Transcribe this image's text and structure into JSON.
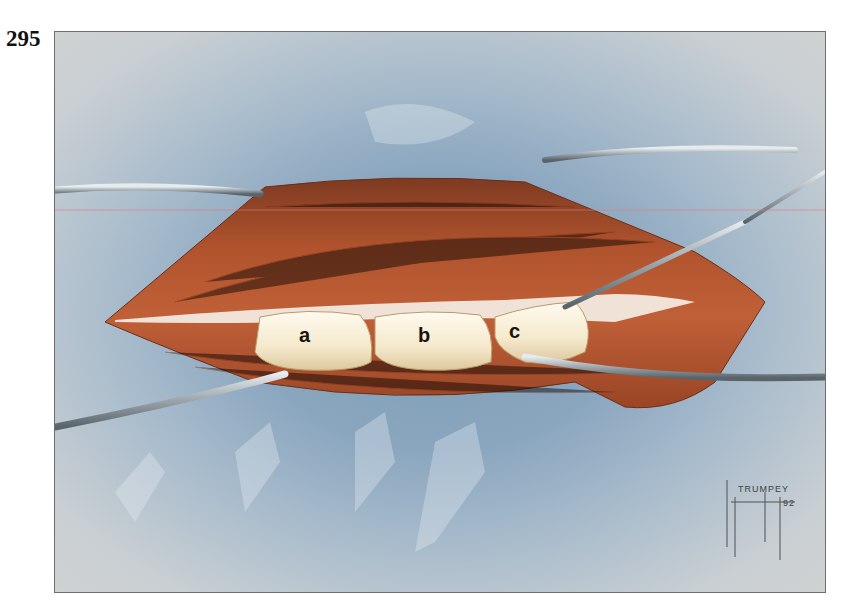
{
  "figure": {
    "number": "295",
    "labels": {
      "a": "a",
      "b": "b",
      "c": "c"
    },
    "signature": {
      "name": "TRUMPEY",
      "year": "92",
      "initials": "Joe"
    }
  },
  "colors": {
    "drape_blue": "#86a3bd",
    "frame_bg": "#cfd1d2",
    "muscle": "#b4532c",
    "muscle_dark": "#8a3a1c",
    "bone": "#f4e8cc",
    "instrument": "#9aa3a8"
  }
}
